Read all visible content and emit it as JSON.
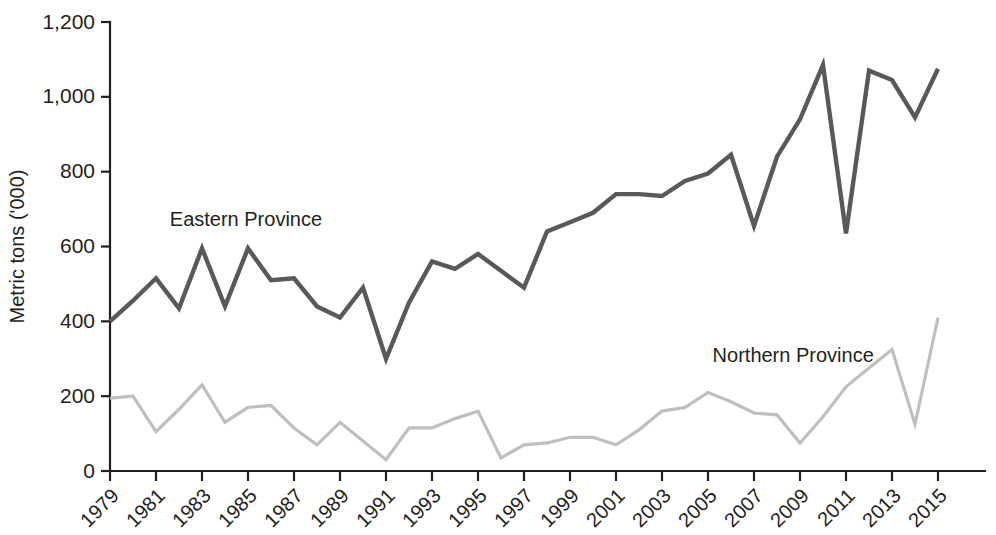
{
  "chart_data": {
    "type": "line",
    "title": "",
    "xlabel": "",
    "ylabel": "Metric tons ('000)",
    "ylim": [
      0,
      1200
    ],
    "xlim": [
      1979,
      2015
    ],
    "grid": false,
    "legend_position": "inline-annotation",
    "ytick_labels": [
      "0",
      "200",
      "400",
      "600",
      "800",
      "1,000",
      "1,200"
    ],
    "ytick_values": [
      0,
      200,
      400,
      600,
      800,
      1000,
      1200
    ],
    "xtick_labels": [
      "1979",
      "1981",
      "1983",
      "1985",
      "1987",
      "1989",
      "1991",
      "1993",
      "1995",
      "1997",
      "1999",
      "2001",
      "2003",
      "2005",
      "2007",
      "2009",
      "2011",
      "2013",
      "2015"
    ],
    "xtick_values": [
      1979,
      1981,
      1983,
      1985,
      1987,
      1989,
      1991,
      1993,
      1995,
      1997,
      1999,
      2001,
      2003,
      2005,
      2007,
      2009,
      2011,
      2013,
      2015
    ],
    "x": [
      1979,
      1980,
      1981,
      1982,
      1983,
      1984,
      1985,
      1986,
      1987,
      1988,
      1989,
      1990,
      1991,
      1992,
      1993,
      1994,
      1995,
      1996,
      1997,
      1998,
      1999,
      2000,
      2001,
      2002,
      2003,
      2004,
      2005,
      2006,
      2007,
      2008,
      2009,
      2010,
      2011,
      2012,
      2013,
      2014,
      2015
    ],
    "series": [
      {
        "name": "Eastern Province",
        "color": "#595959",
        "label_x": 1981.6,
        "label_y": 655,
        "values": [
          400,
          455,
          515,
          435,
          595,
          440,
          595,
          510,
          515,
          440,
          410,
          490,
          300,
          450,
          560,
          540,
          580,
          535,
          490,
          640,
          665,
          690,
          740,
          740,
          735,
          775,
          795,
          845,
          655,
          840,
          940,
          1085,
          635,
          1070,
          1045,
          945,
          1075
        ]
      },
      {
        "name": "Northern Province",
        "color": "#bfbfbf",
        "label_x": 2005.2,
        "label_y": 290,
        "values": [
          195,
          200,
          105,
          165,
          230,
          130,
          170,
          175,
          115,
          70,
          130,
          80,
          30,
          115,
          115,
          140,
          160,
          35,
          70,
          75,
          90,
          90,
          70,
          110,
          160,
          170,
          210,
          185,
          155,
          150,
          75,
          145,
          225,
          275,
          325,
          125,
          410
        ]
      }
    ]
  },
  "annotations": {
    "eastern_label": "Eastern Province",
    "northern_label": "Northern Province"
  }
}
